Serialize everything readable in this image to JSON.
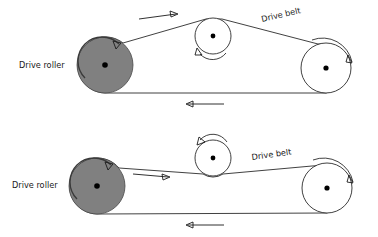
{
  "figure": {
    "type": "technical-diagram",
    "background_color": "#ffffff",
    "line_color": "#2b2b2b",
    "roller_fill_color": "#808080",
    "pulley_fill_color": "#ffffff",
    "hub_color": "#000000"
  },
  "diagrams": [
    {
      "id": "top-diagram",
      "name": "idler-on-top-of-belt",
      "labels": {
        "drive_roller": "Drive roller",
        "drive_belt": "Drive belt"
      },
      "components": [
        {
          "name": "drive-roller",
          "kind": "driven-roller",
          "cx": 105,
          "cy": 65,
          "r": 28,
          "fill": "#808080",
          "rotation": "clockwise"
        },
        {
          "name": "idler-pulley",
          "kind": "idler",
          "cx": 213,
          "cy": 36,
          "r": 18,
          "fill": "#ffffff",
          "rotation": "counter-clockwise",
          "belt_contact": "top"
        },
        {
          "name": "tail-pulley",
          "kind": "pulley",
          "cx": 326,
          "cy": 68,
          "r": 25,
          "fill": "#ffffff",
          "rotation": "clockwise"
        }
      ],
      "belt_direction": {
        "upper_span": "right",
        "lower_span": "left"
      }
    },
    {
      "id": "bottom-diagram",
      "name": "idler-under-belt",
      "labels": {
        "drive_roller": "Drive roller",
        "drive_belt": "Drive belt"
      },
      "components": [
        {
          "name": "drive-roller",
          "kind": "driven-roller",
          "cx": 97,
          "cy": 186,
          "r": 28,
          "fill": "#808080",
          "rotation": "clockwise"
        },
        {
          "name": "idler-pulley",
          "kind": "idler",
          "cx": 213,
          "cy": 158,
          "r": 18,
          "fill": "#ffffff",
          "rotation": "counter-clockwise",
          "belt_contact": "bottom"
        },
        {
          "name": "tail-pulley",
          "kind": "pulley",
          "cx": 327,
          "cy": 188,
          "r": 25,
          "fill": "#ffffff",
          "rotation": "clockwise"
        }
      ],
      "belt_direction": {
        "upper_span": "right",
        "lower_span": "left"
      }
    }
  ]
}
